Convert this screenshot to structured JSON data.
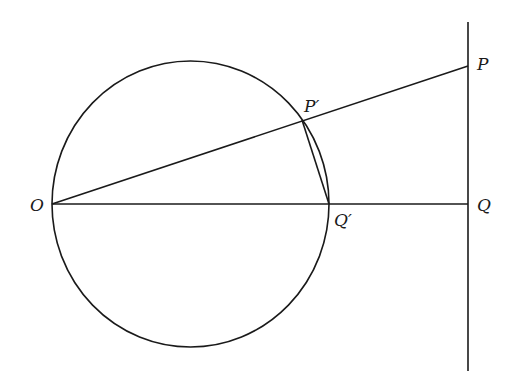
{
  "diagram": {
    "type": "geometry-inversion",
    "colors": {
      "stroke": "#1a1a1a",
      "background": "#ffffff"
    },
    "points": {
      "O": {
        "label": "O",
        "x": 52,
        "y": 204
      },
      "P": {
        "label": "P",
        "x": 468,
        "y": 66
      },
      "Pp": {
        "label": "P′",
        "x": 302,
        "y": 120
      },
      "Q": {
        "label": "Q",
        "x": 468,
        "y": 204
      },
      "Qp": {
        "label": "Q′",
        "x": 329,
        "y": 204
      }
    },
    "circle": {
      "cx": 190.5,
      "cy": 204,
      "rx": 138.5,
      "ry": 143
    },
    "vertical_line": {
      "x": 468,
      "y1": 22,
      "y2": 371
    },
    "segments": [
      {
        "from": "O",
        "to": "P"
      },
      {
        "from": "O",
        "to": "Q"
      },
      {
        "from": "Pp",
        "to": "Qp"
      }
    ]
  }
}
